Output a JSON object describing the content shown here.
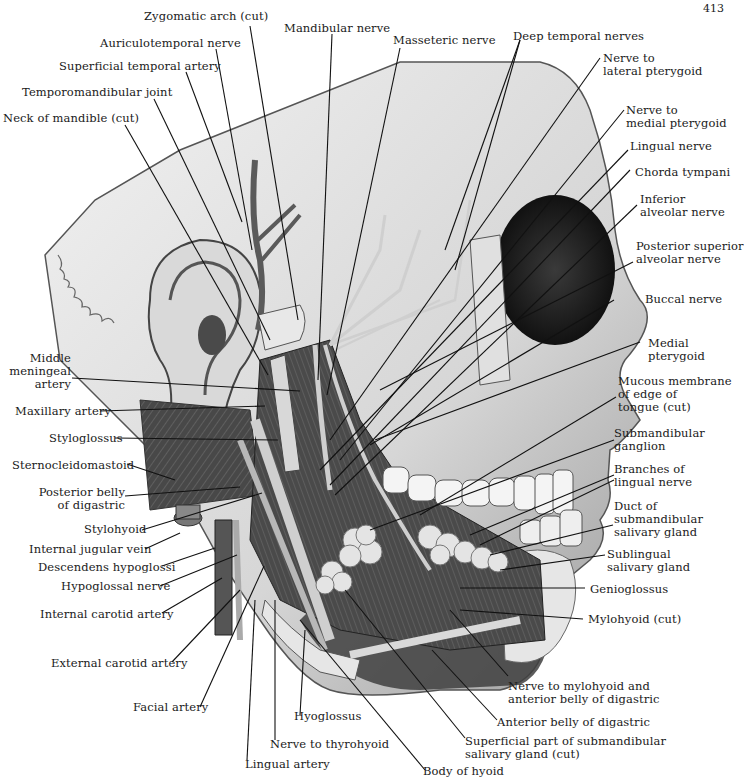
{
  "page_number": "413",
  "figure": {
    "labels": {
      "zygomatic_arch": "Zygomatic arch (cut)",
      "mandibular_nerve": "Mandibular nerve",
      "masseteric_nerve": "Masseteric nerve",
      "deep_temporal_nerves": "Deep temporal nerves",
      "auriculotemporal_nerve": "Auriculotemporal nerve",
      "superficial_temporal_artery": "Superficial temporal artery",
      "temporomandibular_joint": "Temporomandibular joint",
      "neck_of_mandible": "Neck of mandible (cut)",
      "nerve_to_lateral_pterygoid": "Nerve to\nlateral pterygoid",
      "nerve_to_medial_pterygoid": "Nerve to\nmedial pterygoid",
      "lingual_nerve": "Lingual nerve",
      "chorda_tympani": "Chorda tympani",
      "inferior_alveolar_nerve": "Inferior\nalveolar nerve",
      "posterior_superior_alveolar_nerve": "Posterior superior\nalveolar nerve",
      "buccal_nerve": "Buccal nerve",
      "medial_pterygoid": "Medial\npterygoid",
      "mucous_membrane": "Mucous membrane\nof edge of\ntongue (cut)",
      "submandibular_ganglion": "Submandibular\nganglion",
      "branches_of_lingual_nerve": "Branches of\nlingual nerve",
      "duct_of_submandibular_gland": "Duct of\nsubmandibular\nsalivary gland",
      "sublingual_gland": "Sublingual\nsalivary gland",
      "genioglossus": "Genioglossus",
      "mylohyoid": "Mylohyoid (cut)",
      "nerve_to_mylohyoid": "Nerve to mylohyoid and\nanterior belly of digastric",
      "anterior_belly_digastric": "Anterior belly of digastric",
      "superficial_part_submandibular": "Superficial part of submandibular\nsalivary gland (cut)",
      "body_of_hyoid": "Body of hyoid",
      "middle_meningeal_artery": "Middle\nmeningeal\nartery",
      "maxillary_artery": "Maxillary artery",
      "styloglossus": "Styloglossus",
      "sternocleidomastoid": "Sternocleidomastoid",
      "posterior_belly_digastric": "Posterior belly\nof digastric",
      "stylohyoid": "Stylohyoid",
      "internal_jugular_vein": "Internal jugular vein",
      "descendens_hypoglossi": "Descendens hypoglossi",
      "hypoglossal_nerve": "Hypoglossal nerve",
      "internal_carotid_artery": "Internal carotid artery",
      "external_carotid_artery": "External carotid artery",
      "facial_artery": "Facial artery",
      "hyoglossus": "Hyoglossus",
      "nerve_to_thyrohyoid": "Nerve to thyrohyoid",
      "lingual_artery": "Lingual artery"
    }
  }
}
